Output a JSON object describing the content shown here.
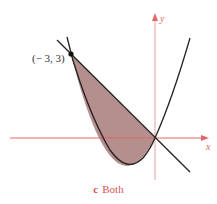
{
  "figure": {
    "axes": {
      "x_label": "x",
      "y_label": "y",
      "axis_color": "#e06666"
    },
    "point": {
      "label": "(− 3, 3)",
      "x": -3,
      "y": 3
    },
    "curves": [
      {
        "name": "parabola",
        "equation": "y = x^2 + 2x",
        "color": "#222222"
      },
      {
        "name": "line",
        "equation": "y = -x",
        "color": "#222222"
      }
    ],
    "shaded_region": {
      "between": [
        "line",
        "parabola"
      ],
      "x_range": [
        -3,
        0
      ],
      "fill": "#b38b8b"
    },
    "caption": {
      "letter": "c",
      "text": "Both"
    }
  }
}
